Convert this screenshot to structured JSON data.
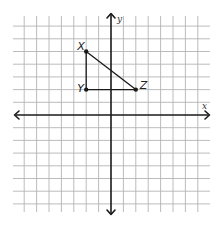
{
  "figure": {
    "type": "coordinate-plane",
    "axes": {
      "x_label": "x",
      "y_label": "y",
      "x_range": [
        -7,
        7
      ],
      "y_range": [
        -7,
        7
      ],
      "grid": true,
      "arrows": "both-ends"
    },
    "triangle": {
      "vertices": [
        {
          "name": "X",
          "x": -2,
          "y": 5
        },
        {
          "name": "Y",
          "x": -2,
          "y": 2
        },
        {
          "name": "Z",
          "x": 2,
          "y": 2
        }
      ],
      "edges": [
        [
          "X",
          "Y"
        ],
        [
          "Y",
          "Z"
        ],
        [
          "X",
          "Z"
        ]
      ]
    },
    "colors": {
      "grid": "#b4b4b4",
      "axis": "#1a1a1a",
      "background": "#ffffff"
    }
  }
}
